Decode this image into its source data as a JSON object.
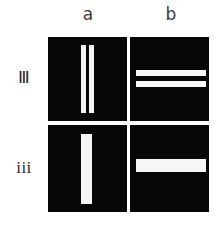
{
  "figure": {
    "background_color": "#ffffff",
    "panel_color": "#070707",
    "bar_color": "#f6f6f6",
    "column_labels": [
      {
        "id": "a",
        "label": "a"
      },
      {
        "id": "b",
        "label": "b"
      }
    ],
    "row_labels": [
      {
        "id": "III",
        "label": "Ⅲ"
      },
      {
        "id": "iii",
        "label": "iii"
      }
    ],
    "panels": [
      {
        "id": "IIIa",
        "row": "Ⅲ",
        "column": "a",
        "orientation": "vertical",
        "bar_count": 2,
        "bar_thickness": "thin"
      },
      {
        "id": "IIIb",
        "row": "Ⅲ",
        "column": "b",
        "orientation": "horizontal",
        "bar_count": 2,
        "bar_thickness": "thin"
      },
      {
        "id": "iiia",
        "row": "iii",
        "column": "a",
        "orientation": "vertical",
        "bar_count": 1,
        "bar_thickness": "thick"
      },
      {
        "id": "iiib",
        "row": "iii",
        "column": "b",
        "orientation": "horizontal",
        "bar_count": 1,
        "bar_thickness": "thick"
      }
    ]
  }
}
